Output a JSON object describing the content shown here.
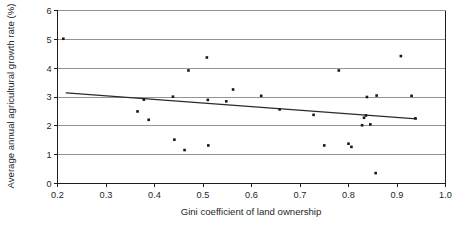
{
  "chart_data": {
    "type": "scatter",
    "title": "",
    "subtitle": "",
    "xlabel": "Gini coefficient of land ownership",
    "ylabel": "Average annual agricultural growth rate (%)",
    "xlim": [
      0.2,
      1.0
    ],
    "ylim": [
      0,
      6
    ],
    "xticks": [
      "0.2",
      "0.3",
      "0.4",
      "0.5",
      "0.6",
      "0.7",
      "0.8",
      "0.9",
      "1.0"
    ],
    "xtick_values": [
      0.2,
      0.3,
      0.4,
      0.5,
      0.6,
      0.7,
      0.8,
      0.9,
      1.0
    ],
    "yticks": [
      "0",
      "1",
      "2",
      "3",
      "4",
      "5",
      "6"
    ],
    "ytick_values": [
      0,
      1,
      2,
      3,
      4,
      5,
      6
    ],
    "grid": "horizontal",
    "legend": "none",
    "marker_style": "small-filled-square",
    "marker_color": "#171717",
    "trendline_color": "#2a2a2a",
    "axis_color": "#1d1d1d",
    "gridline_color": "#6f6f6f",
    "points": [
      {
        "x": 0.212,
        "y": 5.02
      },
      {
        "x": 0.365,
        "y": 2.5
      },
      {
        "x": 0.378,
        "y": 2.91
      },
      {
        "x": 0.388,
        "y": 2.21
      },
      {
        "x": 0.438,
        "y": 3.01
      },
      {
        "x": 0.441,
        "y": 1.52
      },
      {
        "x": 0.462,
        "y": 1.16
      },
      {
        "x": 0.47,
        "y": 3.92
      },
      {
        "x": 0.508,
        "y": 4.37
      },
      {
        "x": 0.51,
        "y": 2.9
      },
      {
        "x": 0.511,
        "y": 1.32
      },
      {
        "x": 0.548,
        "y": 2.85
      },
      {
        "x": 0.562,
        "y": 3.26
      },
      {
        "x": 0.62,
        "y": 3.04
      },
      {
        "x": 0.658,
        "y": 2.57
      },
      {
        "x": 0.728,
        "y": 2.38
      },
      {
        "x": 0.75,
        "y": 1.32
      },
      {
        "x": 0.78,
        "y": 3.92
      },
      {
        "x": 0.8,
        "y": 1.38
      },
      {
        "x": 0.806,
        "y": 1.27
      },
      {
        "x": 0.828,
        "y": 2.02
      },
      {
        "x": 0.832,
        "y": 2.28
      },
      {
        "x": 0.836,
        "y": 2.36
      },
      {
        "x": 0.838,
        "y": 3.0
      },
      {
        "x": 0.845,
        "y": 2.05
      },
      {
        "x": 0.856,
        "y": 0.36
      },
      {
        "x": 0.858,
        "y": 3.05
      },
      {
        "x": 0.908,
        "y": 4.42
      },
      {
        "x": 0.93,
        "y": 3.04
      },
      {
        "x": 0.938,
        "y": 2.26
      }
    ],
    "trendline": {
      "name": "linear fit",
      "x": [
        0.218,
        0.94
      ],
      "y": [
        3.14,
        2.24
      ]
    }
  }
}
